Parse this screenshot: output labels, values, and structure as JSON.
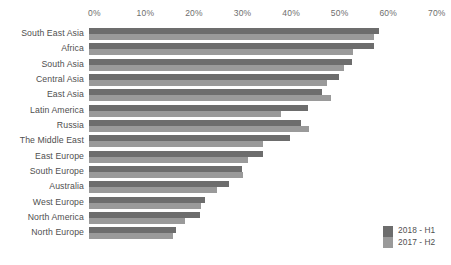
{
  "chart_data": {
    "type": "bar",
    "orientation": "horizontal",
    "title": "",
    "subtitle": "",
    "xlabel": "",
    "ylabel": "",
    "xlim": [
      0,
      70
    ],
    "xtick_labels": [
      "0%",
      "10%",
      "20%",
      "30%",
      "40%",
      "50%",
      "60%",
      "70%"
    ],
    "xticks": [
      0,
      10,
      20,
      30,
      40,
      50,
      60,
      70
    ],
    "grid": false,
    "legend_position": "bottom-right",
    "categories": [
      "South East Asia",
      "Africa",
      "South Asia",
      "Central Asia",
      "East Asia",
      "Latin America",
      "Russia",
      "The Middle East",
      "East Europe",
      "South Europe",
      "Australia",
      "West Europe",
      "North America",
      "North Europe"
    ],
    "series": [
      {
        "name": "2018 - H1",
        "color": "#6d6d6d",
        "values": [
          59.8,
          58.6,
          54.2,
          51.5,
          47.9,
          45.0,
          43.7,
          41.4,
          35.9,
          31.6,
          28.9,
          23.9,
          22.9,
          17.9
        ]
      },
      {
        "name": "2017 - H2",
        "color": "#9a9a9a",
        "values": [
          58.6,
          54.4,
          52.6,
          49.0,
          49.9,
          39.6,
          45.2,
          35.9,
          32.8,
          31.8,
          26.4,
          23.1,
          19.8,
          17.3
        ]
      }
    ],
    "legend": [
      {
        "label": "2018 - H1",
        "color": "#6d6d6d"
      },
      {
        "label": "2017 - H2",
        "color": "#9a9a9a"
      }
    ]
  }
}
